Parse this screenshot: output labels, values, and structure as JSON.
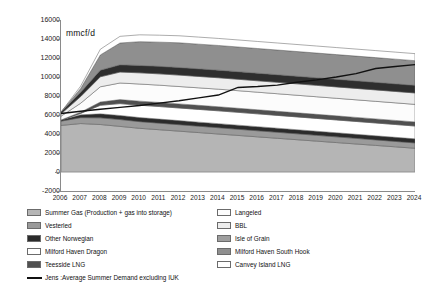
{
  "chart_data": {
    "type": "area",
    "title": "",
    "subtitle": "",
    "xlabel": "",
    "ylabel": "mmcf/d",
    "unit_label": "mmcf/d",
    "grid": false,
    "legend_position": "bottom",
    "stacked": true,
    "categories": [
      "2006",
      "2007",
      "2008",
      "2009",
      "2010",
      "2011",
      "2012",
      "2013",
      "2014",
      "2015",
      "2016",
      "2017",
      "2018",
      "2019",
      "2020",
      "2021",
      "2022",
      "2023",
      "2024"
    ],
    "xlim": [
      2006,
      2024
    ],
    "ylim": [
      -2000,
      16000
    ],
    "ytick_values": [
      -2000,
      0,
      2000,
      4000,
      6000,
      8000,
      10000,
      12000,
      14000,
      16000
    ],
    "ytick_labels": [
      "-2000",
      "0",
      "2000",
      "4000",
      "6000",
      "8000",
      "10000",
      "12000",
      "14000",
      "16000"
    ],
    "series": [
      {
        "name": "Summer Gas (Production + gas into storage)",
        "color": "#b5b5b5",
        "values": [
          4900,
          5100,
          5000,
          4800,
          4600,
          4450,
          4300,
          4150,
          4000,
          3850,
          3700,
          3550,
          3400,
          3250,
          3100,
          2950,
          2800,
          2650,
          2500
        ]
      },
      {
        "name": "Vesterled",
        "color": "#9a9a9a",
        "values": [
          450,
          620,
          700,
          720,
          700,
          690,
          680,
          670,
          660,
          650,
          640,
          630,
          620,
          610,
          600,
          590,
          580,
          570,
          560
        ]
      },
      {
        "name": "Other Norwegian",
        "color": "#2b2b2b",
        "values": [
          120,
          300,
          420,
          430,
          430,
          430,
          430,
          430,
          430,
          430,
          430,
          430,
          430,
          430,
          430,
          430,
          430,
          430,
          430
        ]
      },
      {
        "name": "Milford Haven Dragon",
        "color": "#ffffff",
        "values": [
          0,
          150,
          900,
          1250,
          1300,
          1320,
          1330,
          1340,
          1350,
          1350,
          1350,
          1350,
          1350,
          1350,
          1350,
          1350,
          1350,
          1350,
          1350
        ]
      },
      {
        "name": "Teesside LNG",
        "color": "#505050",
        "values": [
          0,
          120,
          350,
          420,
          430,
          430,
          430,
          430,
          430,
          430,
          430,
          430,
          430,
          430,
          430,
          430,
          430,
          430,
          430
        ]
      },
      {
        "name": "Langeled",
        "color": "#fcfcfc",
        "values": [
          400,
          950,
          1600,
          1750,
          1800,
          1820,
          1830,
          1840,
          1850,
          1850,
          1850,
          1850,
          1850,
          1850,
          1850,
          1850,
          1850,
          1850,
          1850
        ]
      },
      {
        "name": "BBL",
        "color": "#ededed",
        "values": [
          250,
          700,
          1050,
          1150,
          1180,
          1190,
          1200,
          1200,
          1200,
          1200,
          1200,
          1200,
          1200,
          1200,
          1200,
          1200,
          1200,
          1200,
          1200
        ]
      },
      {
        "name": "Isle of Grain",
        "color": "#2e2e2e",
        "values": [
          180,
          450,
          700,
          760,
          780,
          790,
          800,
          800,
          800,
          800,
          800,
          800,
          800,
          800,
          800,
          800,
          800,
          800,
          800
        ]
      },
      {
        "name": "Milford Haven South Hook",
        "color": "#8f8f8f",
        "values": [
          0,
          400,
          1600,
          2300,
          2500,
          2550,
          2600,
          2600,
          2600,
          2600,
          2600,
          2600,
          2600,
          2600,
          2600,
          2600,
          2600,
          2600,
          2600
        ]
      },
      {
        "name": "Canvey Island LNG",
        "color": "#ffffff",
        "values": [
          0,
          250,
          600,
          700,
          720,
          730,
          740,
          740,
          740,
          740,
          740,
          740,
          740,
          740,
          740,
          740,
          740,
          740,
          740
        ]
      }
    ],
    "demand_line": {
      "name": "Jens :Average Summer Demand excluding IUK",
      "color": "#111111",
      "values": [
        6150,
        6400,
        6600,
        6800,
        7000,
        7250,
        7500,
        7800,
        8100,
        8900,
        9000,
        9150,
        9450,
        9700,
        10000,
        10350,
        10900,
        11100,
        11300
      ]
    }
  },
  "y_axis": {
    "ticks": [
      "16000",
      "14000",
      "12000",
      "10000",
      "8000",
      "6000",
      "4000",
      "2000",
      "0",
      "-2000"
    ]
  },
  "x_axis": {
    "ticks": [
      "2006",
      "2007",
      "2008",
      "2009",
      "2010",
      "2011",
      "2012",
      "2013",
      "2014",
      "2015",
      "2016",
      "2017",
      "2018",
      "2019",
      "2020",
      "2021",
      "2022",
      "2023",
      "2024"
    ]
  },
  "legend": {
    "left_column": [
      {
        "label": "Summer Gas (Production + gas into storage)",
        "color": "#b5b5b5"
      },
      {
        "label": "Vesterled",
        "color": "#9a9a9a"
      },
      {
        "label": "Other Norwegian",
        "color": "#2b2b2b"
      },
      {
        "label": "Milford Haven Dragon",
        "color": "#ffffff"
      },
      {
        "label": "Teesside LNG",
        "color": "#505050"
      }
    ],
    "right_column": [
      {
        "label": "Langeled",
        "color": "#fcfcfc"
      },
      {
        "label": "BBL",
        "color": "#ededed"
      },
      {
        "label": "Isle of Grain",
        "color": "#9e9e9e"
      },
      {
        "label": "Milford Haven South Hook",
        "color": "#8f8f8f"
      },
      {
        "label": "Canvey Island LNG",
        "color": "#ffffff"
      }
    ],
    "line_entry": {
      "label": "Jens :Average Summer Demand excluding IUK",
      "color": "#111111"
    }
  }
}
